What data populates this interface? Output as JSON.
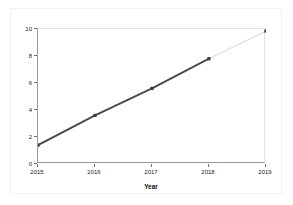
{
  "chart_data": {
    "type": "line",
    "title": "",
    "xlabel": "Year",
    "ylabel": "Earnings Per Share ($)",
    "categories": [
      "2015",
      "2016",
      "2017",
      "2018",
      "2019"
    ],
    "x": [
      2015,
      2016,
      2017,
      2018,
      2019
    ],
    "values": [
      1.4,
      3.6,
      5.6,
      7.8,
      9.85
    ],
    "series": [
      {
        "name": "Earnings Per Share",
        "values": [
          1.4,
          3.6,
          5.6,
          7.8,
          9.85
        ]
      }
    ],
    "xlim": [
      2015,
      2019
    ],
    "ylim": [
      0,
      10
    ],
    "ytick_labels": [
      "0",
      "2",
      "4",
      "6",
      "8",
      "10"
    ],
    "ytick_values": [
      0,
      2,
      4,
      6,
      8,
      10
    ],
    "xtick_labels": [
      "2015",
      "2016",
      "2017",
      "2018",
      "2019"
    ],
    "xtick_values": [
      2015,
      2016,
      2017,
      2018,
      2019
    ],
    "grid": false,
    "legend": "none",
    "marker": "filled-square",
    "segment_styles": [
      "solid-thick",
      "solid-thick",
      "solid-thick",
      "thin-light"
    ],
    "colors": {
      "line": "#4a4a4a",
      "projected_line": "#c8c8c8",
      "marker": "#3a3a3a",
      "axis": "#9a9a9a",
      "text": "#1a1a1a",
      "background": "#ffffff",
      "frame": "#f2f2f2"
    }
  }
}
